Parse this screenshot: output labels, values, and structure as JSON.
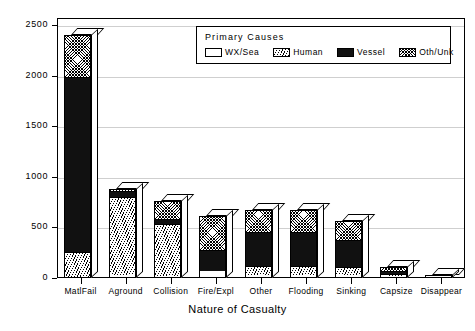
{
  "chart_data": {
    "type": "bar",
    "subtype": "stacked-bar-3d",
    "title": "",
    "xlabel": "Nature of Casualty",
    "ylabel": "",
    "ylim": [
      0,
      2500
    ],
    "yticks": [
      0,
      500,
      1000,
      1500,
      2000,
      2500
    ],
    "ytick_labels": [
      "0",
      "500",
      "1000",
      "1500",
      "2000",
      "2500"
    ],
    "grid": true,
    "grid_axis": "y",
    "legend_position": "top-right-inside",
    "legend_title": "Primary Causes",
    "categories": [
      "MatlFail",
      "Aground",
      "Collision",
      "Fire/Expl",
      "Other",
      "Flooding",
      "Sinking",
      "Capsize",
      "Disappear"
    ],
    "series": [
      {
        "name": "WX/Sea",
        "pattern": "empty",
        "values": [
          0,
          20,
          10,
          60,
          20,
          15,
          20,
          5,
          5
        ]
      },
      {
        "name": "Human",
        "pattern": "hatch",
        "values": [
          250,
          770,
          510,
          0,
          90,
          95,
          80,
          20,
          5
        ]
      },
      {
        "name": "Vessel",
        "pattern": "solid",
        "values": [
          1730,
          60,
          50,
          210,
          330,
          330,
          270,
          35,
          5
        ]
      },
      {
        "name": "Oth/Unk",
        "pattern": "checker",
        "values": [
          420,
          30,
          190,
          340,
          230,
          230,
          190,
          50,
          10
        ]
      }
    ],
    "totals": [
      2400,
      880,
      760,
      610,
      670,
      670,
      560,
      110,
      25
    ]
  },
  "legend": {
    "title": "Primary Causes",
    "entries": [
      {
        "label": "WX/Sea",
        "pattern": "empty"
      },
      {
        "label": "Human",
        "pattern": "hatch"
      },
      {
        "label": "Vessel",
        "pattern": "solid"
      },
      {
        "label": "Oth/Unk",
        "pattern": "checker"
      }
    ]
  },
  "axis": {
    "x_title": "Nature of Casualty",
    "y_tick_labels": [
      "2500",
      "2000",
      "1500",
      "1000",
      "500",
      "0"
    ]
  }
}
